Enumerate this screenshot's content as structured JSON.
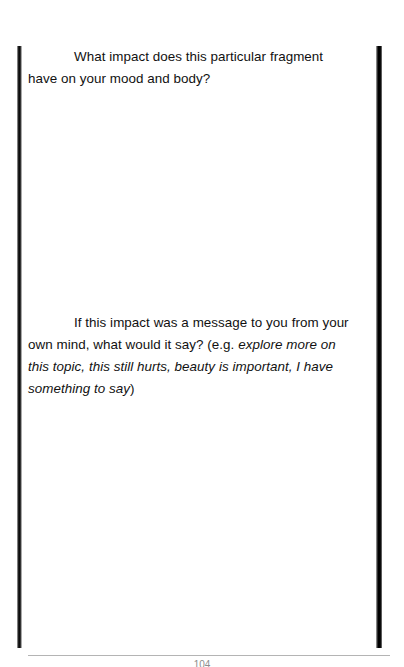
{
  "document": {
    "type": "scanned-workbook-page",
    "page_number": "104",
    "paragraphs": [
      {
        "id": "impact-question",
        "indent": true,
        "runs": [
          {
            "style": "roman",
            "text": "What impact does this particular fragment have on your mood and body?"
          }
        ]
      },
      {
        "id": "message-question",
        "indent": true,
        "runs": [
          {
            "style": "roman",
            "text": "If this impact was a message to you from your own mind, what would it say? (e.g. "
          },
          {
            "style": "italic",
            "text": "explore more on this topic, this still hurts, beauty is important, I have something to say"
          },
          {
            "style": "roman",
            "text": ")"
          }
        ]
      }
    ]
  },
  "artifacts": {
    "left_bar_label": "page-edge-shadow-left",
    "right_bar_label": "page-edge-shadow-right",
    "footer_rule_label": "footer-separator"
  },
  "colors": {
    "page_background": "#ffffff",
    "body_text": "#111111",
    "footer_rule": "#b4b4b4",
    "page_number": "#8d8d8d",
    "scan_bar_dark": "#000000"
  }
}
